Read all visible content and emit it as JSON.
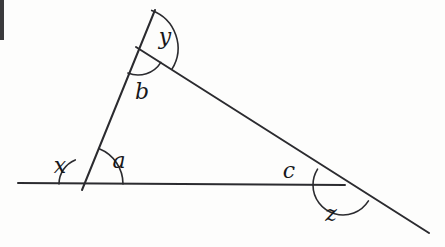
{
  "figure": {
    "background_color": "#fdfdfc",
    "ink_color": "#2b2b2f",
    "canvas": {
      "width": 445,
      "height": 247
    }
  },
  "labels": {
    "x": {
      "text": "x",
      "cx": 60,
      "cy": 167
    },
    "a": {
      "text": "a",
      "cx": 119,
      "cy": 162
    },
    "b": {
      "text": "b",
      "cx": 142,
      "cy": 93
    },
    "y": {
      "text": "y",
      "cx": 165,
      "cy": 38
    },
    "c": {
      "text": "c",
      "cx": 289,
      "cy": 172
    },
    "z": {
      "text": "z",
      "cx": 331,
      "cy": 215
    }
  },
  "lines": [
    {
      "name": "horizontal-base-line",
      "x1": 18,
      "y1": 183,
      "x2": 345,
      "y2": 185,
      "width": 2.0
    },
    {
      "name": "steep-transversal-line",
      "x1": 155,
      "y1": 10,
      "x2": 82,
      "y2": 190,
      "width": 2.0
    },
    {
      "name": "descending-diagonal-line",
      "x1": 136,
      "y1": 47,
      "x2": 429,
      "y2": 233,
      "width": 2.0
    }
  ],
  "arcs": [
    {
      "name": "angle-arc-x",
      "vertex_x": 85,
      "vertex_y": 184,
      "radius": 26,
      "start_deg": 180,
      "end_deg": 248,
      "width": 1.6
    },
    {
      "name": "angle-arc-a",
      "vertex_x": 85,
      "vertex_y": 184,
      "radius": 38,
      "start_deg": 292,
      "end_deg": 360,
      "width": 1.6
    },
    {
      "name": "angle-arc-b",
      "vertex_x": 138,
      "vertex_y": 48,
      "radius": 27,
      "start_deg": 32,
      "end_deg": 112,
      "width": 1.6
    },
    {
      "name": "angle-arc-y",
      "vertex_x": 138,
      "vertex_y": 48,
      "radius": 40,
      "start_deg": 290,
      "end_deg": 32,
      "width": 1.6
    },
    {
      "name": "angle-arc-c",
      "vertex_x": 343,
      "vertex_y": 185,
      "radius": 30,
      "start_deg": 180,
      "end_deg": 212,
      "width": 1.6
    },
    {
      "name": "angle-arc-z",
      "vertex_x": 343,
      "vertex_y": 185,
      "radius": 30,
      "start_deg": 32,
      "end_deg": 180,
      "width": 1.6
    }
  ],
  "scan_artifact": {
    "name": "left-edge-scan-band",
    "left": 0,
    "top": 0,
    "width": 4,
    "height": 40,
    "color": "#3a3a3c"
  }
}
